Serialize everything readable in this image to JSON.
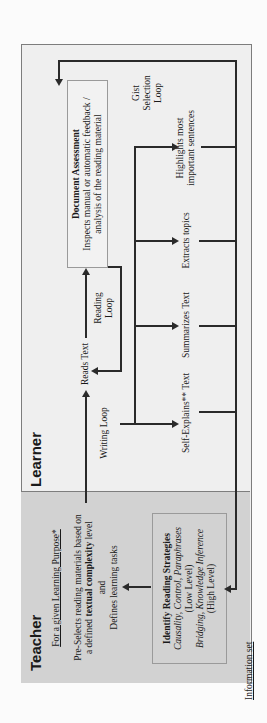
{
  "teacher": {
    "title": "Teacher",
    "purpose": "For a given Learning Purpose*",
    "preselect_line1": "Pre-Selects reading materials based on",
    "preselect_line2_a": "a defined ",
    "preselect_line2_b": "textual complexity",
    "preselect_line2_c": " level",
    "preselect_and": "and",
    "defines_tasks": "Defines learning tasks",
    "strategies": {
      "title": "Identify Reading Strategies",
      "low_items": "Causality, Control, Paraphrases",
      "low_label": "(Low Level)",
      "high_items": "Bridging, Knowledge Inference",
      "high_label": "(High Level)"
    }
  },
  "learner": {
    "title": "Learner",
    "reads_text": "Reads Text",
    "writing_loop": "Writing Loop",
    "reading_loop_1": "Reading",
    "reading_loop_2": "Loop",
    "gist_1": "Gist",
    "gist_2": "Selection",
    "gist_3": "Loop",
    "doc_assessment": {
      "title": "Document Assessment",
      "line1": "Inspects manual or automatic feedback /",
      "line2": "analysis of the reading material"
    },
    "outputs": [
      {
        "label": "Self-Explains** Text"
      },
      {
        "label": "Summarizes Text"
      },
      {
        "label": "Extracts topics"
      },
      {
        "label_1": "Highlights most",
        "label_2": "important sentences"
      }
    ]
  },
  "caption": "Information set",
  "colors": {
    "teacher_bg": "#d2d2d2",
    "learner_bg": "#efefef",
    "border": "#7d7d7d",
    "line": "#2a2a2a"
  }
}
